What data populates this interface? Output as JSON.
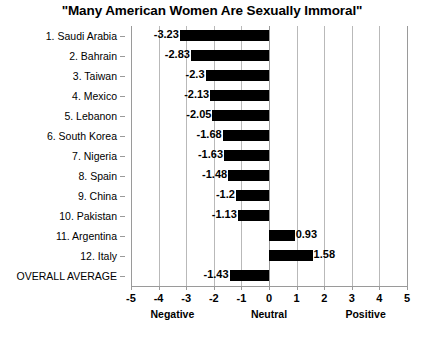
{
  "chart_data": {
    "type": "bar",
    "orientation": "horizontal",
    "title": "\"Many American Women Are Sexually Immoral\"",
    "xlabel": "",
    "ylabel": "",
    "xlim": [
      -5,
      5
    ],
    "xticks": [
      -5,
      -4,
      -3,
      -2,
      -1,
      0,
      1,
      2,
      3,
      4,
      5
    ],
    "xtick_labels": [
      "-5",
      "-4",
      "-3",
      "-2",
      "-1",
      "0",
      "1",
      "2",
      "3",
      "4",
      "5"
    ],
    "grid": true,
    "grid_axis": "x",
    "legend": null,
    "bar_color": "#000000",
    "axis_annotations": [
      {
        "label": "Negative",
        "at": -3.5
      },
      {
        "label": "Neutral",
        "at": 0
      },
      {
        "label": "Positive",
        "at": 3.5
      }
    ],
    "categories": [
      "1. Saudi Arabia",
      "2. Bahrain",
      "3. Taiwan",
      "4. Mexico",
      "5. Lebanon",
      "6. South Korea",
      "7. Nigeria",
      "8. Spain",
      "9. China",
      "10. Pakistan",
      "11. Argentina",
      "12. Italy",
      "OVERALL AVERAGE"
    ],
    "values": [
      -3.23,
      -2.83,
      -2.3,
      -2.13,
      -2.05,
      -1.68,
      -1.63,
      -1.48,
      -1.2,
      -1.13,
      0.93,
      1.58,
      -1.43
    ],
    "value_labels": [
      "-3.23",
      "-2.83",
      "-2.3",
      "-2.13",
      "-2.05",
      "-1.68",
      "-1.63",
      "-1.48",
      "-1.2",
      "-1.13",
      "0.93",
      "1.58",
      "-1.43"
    ]
  }
}
